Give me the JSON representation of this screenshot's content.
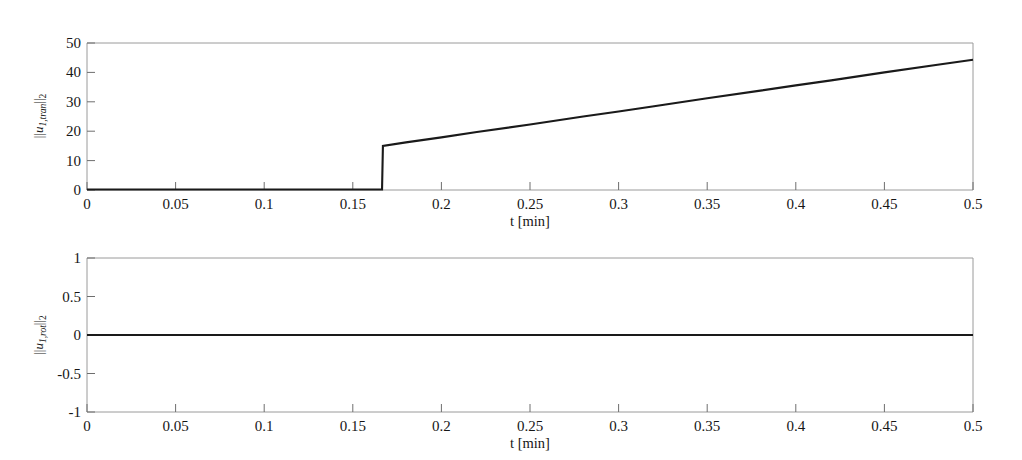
{
  "figure": {
    "background_color": "#ffffff",
    "line_color": "#1a1a1a",
    "axis_color": "#9a9a9a"
  },
  "chart_data": [
    {
      "type": "line",
      "panel": "top",
      "title": "",
      "xlabel": "t [min]",
      "ylabel": "||u_1,tran||_2",
      "ylabel_parts": {
        "bar_left": "||",
        "var": "u",
        "sub_var": "1,tran",
        "bar_right": "||",
        "sub_norm": "2"
      },
      "xlim": [
        0,
        0.5
      ],
      "ylim": [
        0,
        50
      ],
      "xticks": [
        0,
        0.05,
        0.1,
        0.15,
        0.2,
        0.25,
        0.3,
        0.35,
        0.4,
        0.45,
        0.5
      ],
      "xticklabels": [
        "0",
        "0.05",
        "0.1",
        "0.15",
        "0.2",
        "0.25",
        "0.3",
        "0.35",
        "0.4",
        "0.45",
        "0.5"
      ],
      "yticks": [
        0,
        10,
        20,
        30,
        40,
        50
      ],
      "yticklabels": [
        "0",
        "10",
        "20",
        "30",
        "40",
        "50"
      ],
      "grid": false,
      "legend": null,
      "series": [
        {
          "name": "||u_1,tran||_2",
          "x": [
            0.0,
            0.02,
            0.04,
            0.06,
            0.08,
            0.1,
            0.12,
            0.14,
            0.16,
            0.1665,
            0.167,
            0.18,
            0.2,
            0.22,
            0.25,
            0.28,
            0.3,
            0.32,
            0.35,
            0.38,
            0.4,
            0.42,
            0.45,
            0.48,
            0.5
          ],
          "y": [
            0.15,
            0.15,
            0.15,
            0.15,
            0.15,
            0.15,
            0.15,
            0.15,
            0.15,
            0.15,
            15.0,
            16.2,
            17.9,
            19.7,
            22.3,
            25.0,
            26.7,
            28.5,
            31.2,
            33.8,
            35.6,
            37.3,
            40.0,
            42.6,
            44.3
          ]
        }
      ]
    },
    {
      "type": "line",
      "panel": "bottom",
      "title": "",
      "xlabel": "t [min]",
      "ylabel": "||u_1,rot||_2",
      "ylabel_parts": {
        "bar_left": "||",
        "var": "u",
        "sub_var": "1,rot",
        "bar_right": "||",
        "sub_norm": "2"
      },
      "xlim": [
        0,
        0.5
      ],
      "ylim": [
        -1,
        1
      ],
      "xticks": [
        0,
        0.05,
        0.1,
        0.15,
        0.2,
        0.25,
        0.3,
        0.35,
        0.4,
        0.45,
        0.5
      ],
      "xticklabels": [
        "0",
        "0.05",
        "0.1",
        "0.15",
        "0.2",
        "0.25",
        "0.3",
        "0.35",
        "0.4",
        "0.45",
        "0.5"
      ],
      "yticks": [
        -1,
        -0.5,
        0,
        0.5,
        1
      ],
      "yticklabels": [
        "-1",
        "-0.5",
        "0",
        "0.5",
        "1"
      ],
      "grid": false,
      "legend": null,
      "series": [
        {
          "name": "||u_1,rot||_2",
          "x": [
            0.0,
            0.05,
            0.1,
            0.15,
            0.2,
            0.25,
            0.3,
            0.35,
            0.4,
            0.45,
            0.5
          ],
          "y": [
            0,
            0,
            0,
            0,
            0,
            0,
            0,
            0,
            0,
            0,
            0
          ]
        }
      ]
    }
  ]
}
